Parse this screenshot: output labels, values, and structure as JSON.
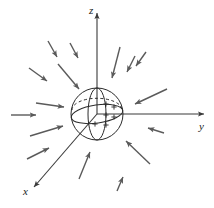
{
  "figure": {
    "background_color": "#ffffff",
    "line_color": "#3a3a3a",
    "arrow_color": "#5a5a5a",
    "sphere_color": "#2b2b2b"
  },
  "axes": [
    {
      "id": "z-axis",
      "label": "z",
      "label_x": 89,
      "label_y": 14,
      "x1": 97,
      "y1": 114,
      "x2": 97,
      "y2": 13,
      "arrow": "up"
    },
    {
      "id": "y-axis",
      "label": "y",
      "label_x": 199,
      "label_y": 130,
      "x1": 97,
      "y1": 114,
      "x2": 204,
      "y2": 114,
      "arrow": "right"
    },
    {
      "id": "x-axis",
      "label": "x",
      "label_x": 23,
      "label_y": 195,
      "x1": 97,
      "y1": 114,
      "x2": 34,
      "y2": 187,
      "arrow": "down-left"
    }
  ],
  "sphere": {
    "id": "origin-sphere",
    "center_x": 97,
    "center_y": 114,
    "radius": 26,
    "meridian_rx": 9,
    "meridian_ry": 26,
    "equator_rx": 26,
    "equator_ry": 9,
    "equator_tilt_deg": -8
  },
  "vector_field": {
    "direction": "inward",
    "count": 16,
    "arrows": [
      {
        "id": "arrow-nw-far",
        "x1": 48,
        "y1": 41,
        "x2": 57,
        "y2": 57
      },
      {
        "id": "arrow-n-left",
        "x1": 58,
        "y1": 64,
        "x2": 79,
        "y2": 89
      },
      {
        "id": "arrow-w-upper",
        "x1": 29,
        "y1": 68,
        "x2": 47,
        "y2": 81
      },
      {
        "id": "arrow-w-mid",
        "x1": 36,
        "y1": 103,
        "x2": 64,
        "y2": 107
      },
      {
        "id": "arrow-w-far",
        "x1": 11,
        "y1": 115,
        "x2": 36,
        "y2": 115
      },
      {
        "id": "arrow-sw-upper",
        "x1": 30,
        "y1": 136,
        "x2": 63,
        "y2": 126
      },
      {
        "id": "arrow-sw-lower",
        "x1": 27,
        "y1": 159,
        "x2": 49,
        "y2": 148
      },
      {
        "id": "arrow-s-left",
        "x1": 79,
        "y1": 179,
        "x2": 90,
        "y2": 152
      },
      {
        "id": "arrow-s-right",
        "x1": 117,
        "y1": 191,
        "x2": 123,
        "y2": 177
      },
      {
        "id": "arrow-se-lower",
        "x1": 150,
        "y1": 164,
        "x2": 126,
        "y2": 141
      },
      {
        "id": "arrow-se-mid",
        "x1": 164,
        "y1": 133,
        "x2": 148,
        "y2": 128
      },
      {
        "id": "arrow-e-upper",
        "x1": 167,
        "y1": 89,
        "x2": 135,
        "y2": 104
      },
      {
        "id": "arrow-ne-far",
        "x1": 146,
        "y1": 52,
        "x2": 136,
        "y2": 66
      },
      {
        "id": "arrow-n-right",
        "x1": 120,
        "y1": 47,
        "x2": 112,
        "y2": 78
      },
      {
        "id": "arrow-nw-mid",
        "x1": 70,
        "y1": 43,
        "x2": 78,
        "y2": 58
      },
      {
        "id": "arrow-ne-upper",
        "x1": 135,
        "y1": 56,
        "x2": 127,
        "y2": 72
      }
    ]
  }
}
